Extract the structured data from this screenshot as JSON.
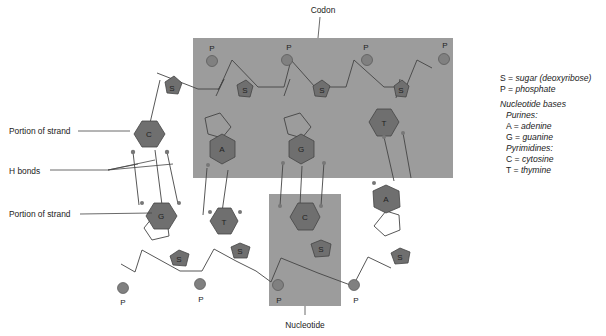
{
  "figure": {
    "title_label": "Codon",
    "nucleotide_label": "Nucleotide",
    "callouts": {
      "portion_top": "Portion of strand",
      "h_bonds": "H bonds",
      "portion_bottom": "Portion of strand"
    },
    "colors": {
      "highlight_box": "#9a9a9a",
      "base_fill": "#6f6f6f",
      "phosphate_fill": "#808080",
      "line": "#444444"
    },
    "top_strand": {
      "phosphates": [
        "P",
        "P",
        "P",
        "P"
      ],
      "sugars": [
        "S",
        "S",
        "S",
        "S"
      ],
      "bases": [
        "C",
        "A",
        "G",
        "T"
      ]
    },
    "bottom_strand": {
      "phosphates": [
        "P",
        "P",
        "P",
        "P"
      ],
      "sugars": [
        "S",
        "S",
        "S",
        "S"
      ],
      "bases": [
        "G",
        "T",
        "C",
        "A"
      ]
    }
  },
  "legend": {
    "s_key": "S",
    "s_eq": " = ",
    "s_val": "sugar (deoxyribose)",
    "p_key": "P",
    "p_eq": " = ",
    "p_val": "phosphate",
    "heading": "Nucleotide bases",
    "purines": "Purines:",
    "a_key": "A",
    "a_val": "adenine",
    "g_key": "G",
    "g_val": "guanine",
    "pyrimidines": "Pyrimidines:",
    "c_key": "C",
    "c_val": "cytosine",
    "t_key": "T",
    "t_val": "thymine",
    "eq": " = "
  }
}
